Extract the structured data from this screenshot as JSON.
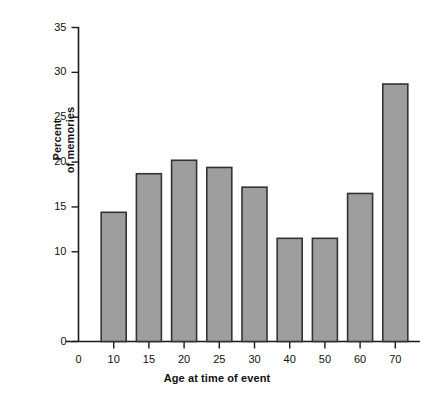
{
  "chart_data": {
    "type": "bar",
    "title": "",
    "subtitle": "",
    "xlabel": "Age at time of event",
    "ylabel": "Percent of memories",
    "ylabel_line1": "Percent",
    "ylabel_line2": "of memories",
    "categories": [
      "0",
      "10",
      "15",
      "20",
      "25",
      "30",
      "40",
      "50",
      "60",
      "70"
    ],
    "values": [
      null,
      14.4,
      18.7,
      20.2,
      19.4,
      17.2,
      11.5,
      11.5,
      16.5,
      28.7
    ],
    "bars": [
      {
        "category": "10",
        "value": 14.4
      },
      {
        "category": "15",
        "value": 18.7
      },
      {
        "category": "20",
        "value": 20.2
      },
      {
        "category": "25",
        "value": 19.4
      },
      {
        "category": "30",
        "value": 17.2
      },
      {
        "category": "40",
        "value": 11.5
      },
      {
        "category": "50",
        "value": 11.5
      },
      {
        "category": "60",
        "value": 16.5
      },
      {
        "category": "70",
        "value": 28.7
      }
    ],
    "ylim": [
      0,
      35
    ],
    "yticks": [
      0,
      5,
      10,
      15,
      20,
      25,
      30,
      35
    ],
    "ytick_labels": [
      "0",
      "5",
      "10",
      "15",
      "20",
      "25",
      "30",
      "35"
    ],
    "ytick_labels_shown": [
      "0",
      "10",
      "15",
      "20",
      "25",
      "30",
      "35"
    ],
    "xtick_labels": [
      "0",
      "10",
      "15",
      "20",
      "25",
      "30",
      "40",
      "50",
      "60",
      "70"
    ],
    "grid": false,
    "legend": false,
    "legend_position": "none",
    "colors": {
      "bar_fill": "#9e9e9e",
      "bar_stroke": "#333333",
      "axis": "#1a1a1a",
      "text": "#111111",
      "background": "#ffffff"
    }
  }
}
